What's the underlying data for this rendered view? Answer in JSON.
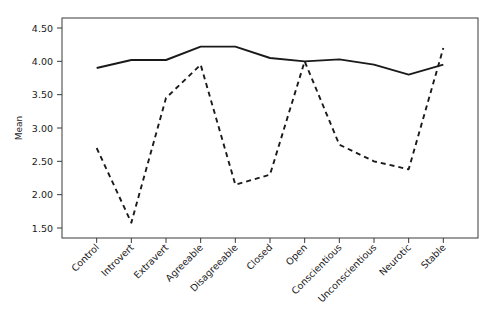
{
  "chart_data": {
    "type": "line",
    "title": "",
    "subtitle": "",
    "xlabel": "",
    "ylabel": "Mean",
    "categories": [
      "Control",
      "Introvert",
      "Extravert",
      "Agreeable",
      "Disagreeable",
      "Closed",
      "Open",
      "Conscientious",
      "Unconscientious",
      "Neurotic",
      "Stable"
    ],
    "series": [
      {
        "name": "solid-series",
        "style": "solid",
        "color": "#1a1a1a",
        "values": [
          3.9,
          4.02,
          4.02,
          4.22,
          4.22,
          4.05,
          4.0,
          4.03,
          3.95,
          3.8,
          3.95
        ]
      },
      {
        "name": "dashed-series",
        "style": "dashed",
        "color": "#1a1a1a",
        "values": [
          2.7,
          1.58,
          3.45,
          3.95,
          2.15,
          2.3,
          4.0,
          2.75,
          2.5,
          2.38,
          4.2
        ]
      }
    ],
    "ylim": [
      1.35,
      4.65
    ],
    "yticks": [
      1.5,
      2.0,
      2.5,
      3.0,
      3.5,
      4.0,
      4.5
    ],
    "ytick_labels": [
      "1.50",
      "2.00",
      "2.50",
      "3.00",
      "3.50",
      "4.00",
      "4.50"
    ],
    "grid": false,
    "legend": "none",
    "xlabel_rotation": -45,
    "frame": true
  },
  "axes": {
    "y_title": "Mean"
  }
}
